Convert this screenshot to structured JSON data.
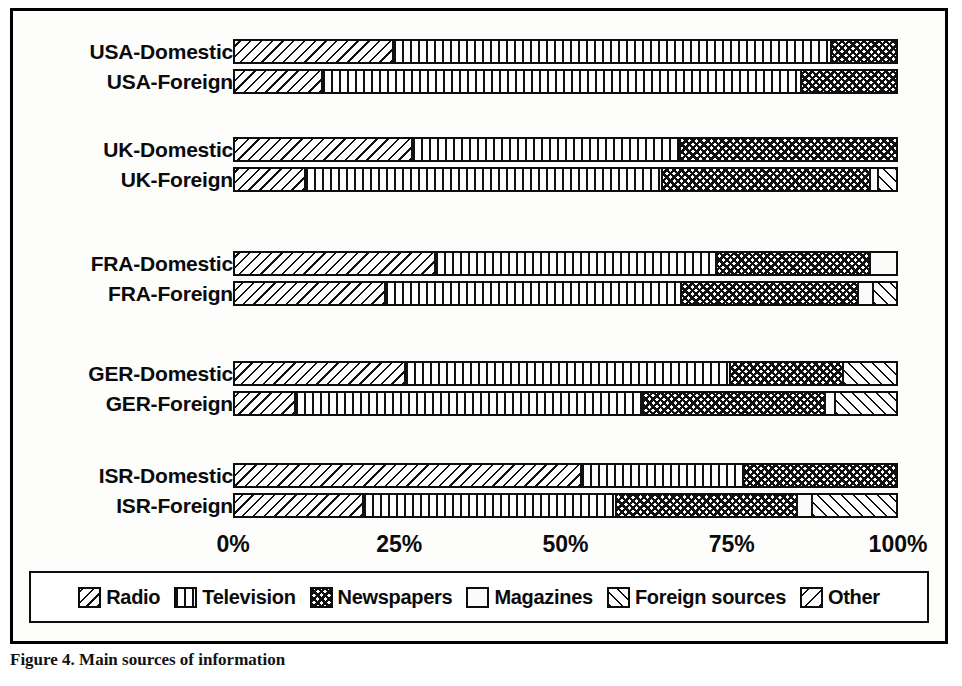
{
  "figure": {
    "caption": "Figure 4. Main sources of information",
    "axis": {
      "ticks": [
        "0%",
        "25%",
        "50%",
        "75%",
        "100%"
      ],
      "tick_positions": [
        0,
        25,
        50,
        75,
        100
      ]
    },
    "legend": {
      "items": [
        {
          "label": "Radio",
          "pattern": "pat-radio",
          "icon": "diagonal-hatch-swatch"
        },
        {
          "label": "Television",
          "pattern": "pat-tv",
          "icon": "vertical-lines-swatch"
        },
        {
          "label": "Newspapers",
          "pattern": "pat-news",
          "icon": "cross-hatch-swatch"
        },
        {
          "label": "Magazines",
          "pattern": "pat-mag",
          "icon": "blank-swatch"
        },
        {
          "label": "Foreign sources",
          "pattern": "pat-foreign",
          "icon": "forward-hatch-swatch"
        },
        {
          "label": "Other",
          "pattern": "pat-other",
          "icon": "sparse-hatch-swatch"
        }
      ]
    }
  },
  "chart_data": {
    "type": "bar",
    "orientation": "horizontal",
    "stacked": true,
    "normalized": true,
    "title": "",
    "subtitle": "",
    "xlabel": "",
    "ylabel": "",
    "xlim": [
      0,
      100
    ],
    "xticks": [
      0,
      25,
      50,
      75,
      100
    ],
    "xticklabels": [
      "0%",
      "25%",
      "50%",
      "75%",
      "100%"
    ],
    "grid": false,
    "legend_position": "bottom",
    "categories": [
      "USA-Domestic",
      "USA-Foreign",
      "UK-Domestic",
      "UK-Foreign",
      "FRA-Domestic",
      "FRA-Foreign",
      "GER-Domestic",
      "GER-Foreign",
      "ISR-Domestic",
      "ISR-Foreign"
    ],
    "series": [
      {
        "name": "Radio",
        "values": [
          23.8,
          13.0,
          26.6,
          10.5,
          30.1,
          22.6,
          25.6,
          9.0,
          52.2,
          19.2
        ]
      },
      {
        "name": "Television",
        "values": [
          66.2,
          72.5,
          40.6,
          54.0,
          42.5,
          44.7,
          49.2,
          52.6,
          24.5,
          38.3
        ]
      },
      {
        "name": "Newspapers",
        "values": [
          10.0,
          14.5,
          32.8,
          31.4,
          23.3,
          26.8,
          17.0,
          27.5,
          23.3,
          27.4
        ]
      },
      {
        "name": "Magazines",
        "values": [
          0.0,
          0.0,
          0.0,
          1.2,
          4.1,
          2.3,
          0.0,
          1.5,
          0.0,
          2.3
        ]
      },
      {
        "name": "Foreign sources",
        "values": [
          0.0,
          0.0,
          0.0,
          2.9,
          0.0,
          3.6,
          8.2,
          9.4,
          0.0,
          12.8
        ]
      },
      {
        "name": "Other",
        "values": [
          0.0,
          0.0,
          0.0,
          0.0,
          0.0,
          0.0,
          0.0,
          0.0,
          0.0,
          0.0
        ]
      }
    ],
    "rows": [
      {
        "label": "USA-Domestic",
        "group": "USA",
        "top": 28,
        "segments": [
          {
            "series": "Radio",
            "value": 23.8,
            "pattern": "pat-radio"
          },
          {
            "series": "Television",
            "value": 66.2,
            "pattern": "pat-tv"
          },
          {
            "series": "Newspapers",
            "value": 10.0,
            "pattern": "pat-news"
          }
        ]
      },
      {
        "label": "USA-Foreign",
        "group": "USA",
        "top": 58,
        "segments": [
          {
            "series": "Radio",
            "value": 13.0,
            "pattern": "pat-radio"
          },
          {
            "series": "Television",
            "value": 72.5,
            "pattern": "pat-tv"
          },
          {
            "series": "Newspapers",
            "value": 14.5,
            "pattern": "pat-news"
          }
        ]
      },
      {
        "label": "UK-Domestic",
        "group": "UK",
        "top": 126,
        "segments": [
          {
            "series": "Radio",
            "value": 26.6,
            "pattern": "pat-radio"
          },
          {
            "series": "Television",
            "value": 40.6,
            "pattern": "pat-tv"
          },
          {
            "series": "Newspapers",
            "value": 32.8,
            "pattern": "pat-news"
          }
        ]
      },
      {
        "label": "UK-Foreign",
        "group": "UK",
        "top": 156,
        "segments": [
          {
            "series": "Radio",
            "value": 10.5,
            "pattern": "pat-radio"
          },
          {
            "series": "Television",
            "value": 54.0,
            "pattern": "pat-tv"
          },
          {
            "series": "Newspapers",
            "value": 31.4,
            "pattern": "pat-news"
          },
          {
            "series": "Magazines",
            "value": 1.2,
            "pattern": "pat-mag"
          },
          {
            "series": "Foreign sources",
            "value": 2.9,
            "pattern": "pat-foreign"
          }
        ]
      },
      {
        "label": "FRA-Domestic",
        "group": "FRA",
        "top": 240,
        "segments": [
          {
            "series": "Radio",
            "value": 30.1,
            "pattern": "pat-radio"
          },
          {
            "series": "Television",
            "value": 42.5,
            "pattern": "pat-tv"
          },
          {
            "series": "Newspapers",
            "value": 23.3,
            "pattern": "pat-news"
          },
          {
            "series": "Magazines",
            "value": 4.1,
            "pattern": "pat-mag"
          }
        ]
      },
      {
        "label": "FRA-Foreign",
        "group": "FRA",
        "top": 270,
        "segments": [
          {
            "series": "Radio",
            "value": 22.6,
            "pattern": "pat-radio"
          },
          {
            "series": "Television",
            "value": 44.7,
            "pattern": "pat-tv"
          },
          {
            "series": "Newspapers",
            "value": 26.8,
            "pattern": "pat-news"
          },
          {
            "series": "Magazines",
            "value": 2.3,
            "pattern": "pat-mag"
          },
          {
            "series": "Foreign sources",
            "value": 3.6,
            "pattern": "pat-foreign"
          }
        ]
      },
      {
        "label": "GER-Domestic",
        "group": "GER",
        "top": 350,
        "segments": [
          {
            "series": "Radio",
            "value": 25.6,
            "pattern": "pat-radio"
          },
          {
            "series": "Television",
            "value": 49.2,
            "pattern": "pat-tv"
          },
          {
            "series": "Newspapers",
            "value": 17.0,
            "pattern": "pat-news"
          },
          {
            "series": "Foreign sources",
            "value": 8.2,
            "pattern": "pat-foreign"
          }
        ]
      },
      {
        "label": "GER-Foreign",
        "group": "GER",
        "top": 380,
        "segments": [
          {
            "series": "Radio",
            "value": 9.0,
            "pattern": "pat-radio"
          },
          {
            "series": "Television",
            "value": 52.6,
            "pattern": "pat-tv"
          },
          {
            "series": "Newspapers",
            "value": 27.5,
            "pattern": "pat-news"
          },
          {
            "series": "Magazines",
            "value": 1.5,
            "pattern": "pat-mag"
          },
          {
            "series": "Foreign sources",
            "value": 9.4,
            "pattern": "pat-foreign"
          }
        ]
      },
      {
        "label": "ISR-Domestic",
        "group": "ISR",
        "top": 452,
        "segments": [
          {
            "series": "Radio",
            "value": 52.2,
            "pattern": "pat-radio"
          },
          {
            "series": "Television",
            "value": 24.5,
            "pattern": "pat-tv"
          },
          {
            "series": "Newspapers",
            "value": 23.3,
            "pattern": "pat-news"
          }
        ]
      },
      {
        "label": "ISR-Foreign",
        "group": "ISR",
        "top": 482,
        "segments": [
          {
            "series": "Radio",
            "value": 19.2,
            "pattern": "pat-radio"
          },
          {
            "series": "Television",
            "value": 38.3,
            "pattern": "pat-tv"
          },
          {
            "series": "Newspapers",
            "value": 27.4,
            "pattern": "pat-news"
          },
          {
            "series": "Magazines",
            "value": 2.3,
            "pattern": "pat-mag"
          },
          {
            "series": "Foreign sources",
            "value": 12.8,
            "pattern": "pat-foreign"
          }
        ]
      }
    ]
  }
}
